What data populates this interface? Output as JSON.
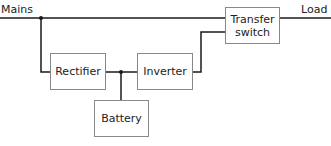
{
  "diagram": {
    "type": "UPS block diagram",
    "labels": {
      "input": "Mains",
      "output": "Load"
    },
    "blocks": {
      "rectifier": "Rectifier",
      "inverter": "Inverter",
      "battery": "Battery",
      "transfer_switch_line1": "Transfer",
      "transfer_switch_line2": "switch"
    },
    "connections": [
      [
        "Mains",
        "Transfer switch"
      ],
      [
        "Mains",
        "Rectifier"
      ],
      [
        "Rectifier",
        "Inverter"
      ],
      [
        "Battery",
        "Rectifier-Inverter junction"
      ],
      [
        "Inverter",
        "Transfer switch"
      ],
      [
        "Transfer switch",
        "Load"
      ]
    ],
    "colors": {
      "line": "#1a1a1a",
      "box_border": "#888888"
    }
  }
}
